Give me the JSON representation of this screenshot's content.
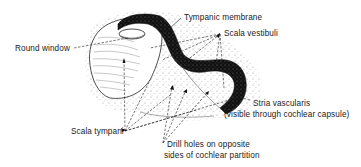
{
  "figure": {
    "labels": {
      "tympanic_membrane": "Tympanic membrane",
      "scala_vestibuli": "Scala vestibuli",
      "round_window": "Round window",
      "stria_vascularis_line1": "Stria vascularis",
      "stria_vascularis_line2": "(visible through cochlear capsule)",
      "scala_tympani": "Scala tympani",
      "drill_holes_line1": "Drill holes on opposite",
      "drill_holes_line2": "sides of cochlear partition"
    },
    "colors": {
      "ink": "#1a1a1a",
      "background": "#ffffff",
      "stipple": "#8a8a8a"
    }
  }
}
